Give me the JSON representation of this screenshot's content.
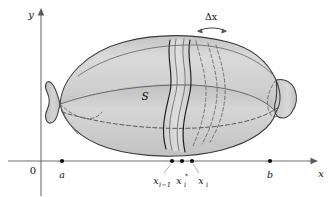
{
  "figure": {
    "name": "surface-of-revolution-band",
    "axes": {
      "y_label": "y",
      "x_label": "x",
      "origin_label": "0"
    },
    "points": [
      {
        "id": "a",
        "label": "a",
        "x": 62,
        "y": 161
      },
      {
        "id": "x_i_minus_1",
        "label": "x",
        "sub": "i−1",
        "x": 172,
        "y": 161
      },
      {
        "id": "x_i_star",
        "label": "x",
        "sub": "i",
        "sup": "*",
        "x": 182,
        "y": 161
      },
      {
        "id": "x_i",
        "label": "x",
        "sub": "i",
        "x": 192,
        "y": 161
      },
      {
        "id": "b",
        "label": "b",
        "x": 270,
        "y": 161
      }
    ],
    "annotations": {
      "surface_label": "S",
      "band_width_label": "Δx"
    },
    "label_text": {
      "x_i_minus_1_base": "x",
      "x_i_minus_1_sub": "i−1",
      "x_i_star_base": "x",
      "x_i_star_sub": "i",
      "x_i_star_sup": "*",
      "x_i_base": "x",
      "x_i_sub": "i"
    },
    "colors": {
      "body_light": "#dcdcdc",
      "body_mid": "#c9c9c9",
      "body_dark": "#b4b4b4",
      "outline": "#3b3b3b",
      "axis": "#6e6e6e",
      "text": "#111111",
      "background": "#ffffff"
    }
  }
}
